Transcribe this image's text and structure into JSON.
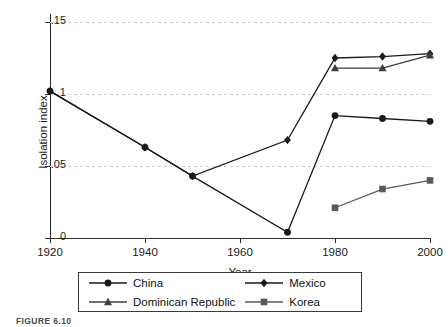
{
  "figure": {
    "caption": "FIGURE 6.10"
  },
  "chart_data": {
    "type": "line",
    "title": "",
    "xlabel": "Year",
    "ylabel": "Isolation index",
    "xlim": [
      1920,
      2000
    ],
    "ylim": [
      0,
      0.15
    ],
    "xticks": [
      1920,
      1940,
      1960,
      1980,
      2000
    ],
    "xtick_labels": [
      "1920",
      "1940",
      "1960",
      "1980",
      "2000"
    ],
    "yticks": [
      0,
      0.05,
      0.1,
      0.15
    ],
    "ytick_labels": [
      "0",
      ".05",
      ".1",
      ".15"
    ],
    "grid": "horizontal-dashed",
    "legend_position": "below-center",
    "series": [
      {
        "name": "China",
        "marker": "circle",
        "color": "#1a1a1a",
        "x": [
          1920,
          1940,
          1950,
          1970,
          1980,
          1990,
          2000
        ],
        "values": [
          0.102,
          0.063,
          0.043,
          0.004,
          0.085,
          0.083,
          0.081
        ]
      },
      {
        "name": "Mexico",
        "marker": "diamond",
        "color": "#1a1a1a",
        "x": [
          1920,
          1940,
          1950,
          1970,
          1980,
          1990,
          2000
        ],
        "values": [
          0.102,
          0.063,
          0.043,
          0.068,
          0.125,
          0.126,
          0.128
        ]
      },
      {
        "name": "Dominican Republic",
        "marker": "triangle",
        "color": "#3c3c3c",
        "x": [
          1980,
          1990,
          2000
        ],
        "values": [
          0.118,
          0.118,
          0.127
        ]
      },
      {
        "name": "Korea",
        "marker": "square",
        "color": "#5a5a5a",
        "x": [
          1980,
          1990,
          2000
        ],
        "values": [
          0.021,
          0.034,
          0.04
        ]
      }
    ]
  },
  "legend": {
    "entries": [
      {
        "label": "China",
        "marker": "circle"
      },
      {
        "label": "Mexico",
        "marker": "diamond"
      },
      {
        "label": "Dominican Republic",
        "marker": "triangle"
      },
      {
        "label": "Korea",
        "marker": "square"
      }
    ]
  }
}
